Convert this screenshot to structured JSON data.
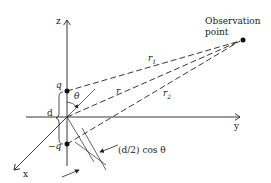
{
  "diagram": {
    "labels": {
      "z_axis": "z",
      "y_axis": "y",
      "x_axis": "x",
      "charge_pos": "q",
      "charge_neg": "−q",
      "separation": "d",
      "theta": "θ",
      "r": "r",
      "r1": "r",
      "r1_sub": "1",
      "r2": "r",
      "r2_sub": "2",
      "observation_line1": "Observation",
      "observation_line2": "point",
      "path_diff": "(d/2) cos θ"
    },
    "colors": {
      "ink": "#222222",
      "background": "#ffffff"
    }
  }
}
